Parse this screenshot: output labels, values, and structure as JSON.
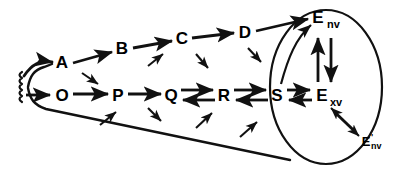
{
  "figure": {
    "type": "pathway-diagram"
  },
  "nodes": {
    "top_row": [
      {
        "id": "A",
        "label": "A",
        "x": 62,
        "y": 68
      },
      {
        "id": "B",
        "label": "B",
        "x": 122,
        "y": 54
      },
      {
        "id": "C",
        "label": "C",
        "x": 182,
        "y": 44
      },
      {
        "id": "D",
        "label": "D",
        "x": 245,
        "y": 38
      }
    ],
    "bottom_row": [
      {
        "id": "O",
        "label": "O",
        "x": 62,
        "y": 97
      },
      {
        "id": "P",
        "label": "P",
        "x": 118,
        "y": 97
      },
      {
        "id": "Q",
        "label": "Q",
        "x": 171,
        "y": 97
      },
      {
        "id": "R",
        "label": "R",
        "x": 224,
        "y": 97
      },
      {
        "id": "S",
        "label": "S",
        "x": 277,
        "y": 97
      }
    ],
    "compartment": [
      {
        "id": "Env",
        "base": "E",
        "subscript": "nv",
        "prime": "",
        "x": 326,
        "y": 22
      },
      {
        "id": "Exv",
        "base": "E",
        "subscript": "xv",
        "prime": "",
        "x": 326,
        "y": 97
      },
      {
        "id": "Eprime_nv",
        "base": "E",
        "subscript": "nv",
        "prime": "'",
        "x": 372,
        "y": 144
      }
    ]
  },
  "edges": {
    "main_top_chain": [
      "A->B",
      "B->C",
      "C->D",
      "D->Env"
    ],
    "main_bottom_chain": [
      "O->P",
      "P->Q"
    ],
    "reversible": [
      "Q<->R",
      "R<->S",
      "S<->Exv",
      "Env<->Exv",
      "Exv<->Eprime_nv"
    ],
    "curved": [
      "S->Env"
    ],
    "source_inputs": [
      "source->A",
      "source->O"
    ],
    "cross_arrows_count": 8
  },
  "colors": {
    "stroke": "#111111",
    "text": "#000000",
    "background": "#ffffff"
  },
  "shapes": {
    "ellipse": {
      "cx": 326,
      "cy": 87,
      "rx": 56,
      "ry": 77
    },
    "cone_label": "funnel",
    "source_label": "wavy-source"
  }
}
